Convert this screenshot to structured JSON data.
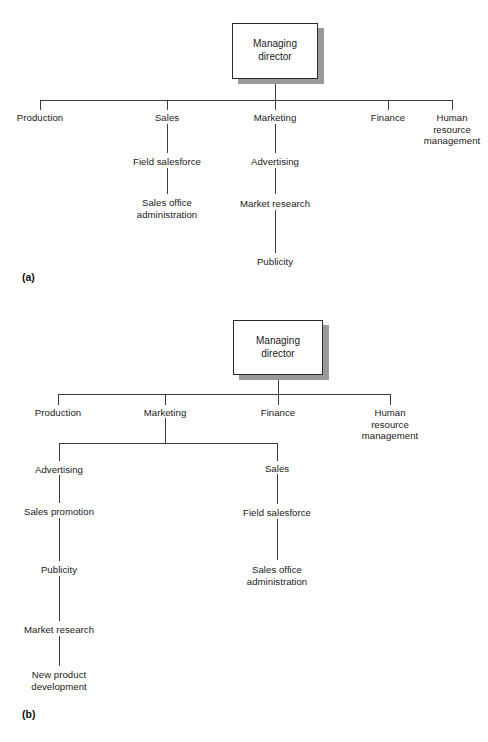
{
  "page": {
    "background_color": "#ffffff",
    "line_color": "#3c3c3c",
    "text_color": "#1a1a1a",
    "shadow_color": "#9a9a9a"
  },
  "figures": [
    {
      "key": "a",
      "caption": "(a)",
      "root": "Managing\ndirector",
      "level1": [
        {
          "key": "production",
          "label": "Production"
        },
        {
          "key": "sales",
          "label": "Sales"
        },
        {
          "key": "marketing",
          "label": "Marketing"
        },
        {
          "key": "finance",
          "label": "Finance"
        },
        {
          "key": "hrm",
          "label": "Human\nresource\nmanagement"
        }
      ],
      "chains": [
        {
          "parent": "sales",
          "nodes": [
            {
              "key": "field-salesforce",
              "label": "Field salesforce"
            },
            {
              "key": "sales-office-administration",
              "label": "Sales office\nadministration"
            }
          ]
        },
        {
          "parent": "marketing",
          "nodes": [
            {
              "key": "advertising",
              "label": "Advertising"
            },
            {
              "key": "market-research",
              "label": "Market research"
            },
            {
              "key": "publicity",
              "label": "Publicity"
            }
          ]
        }
      ]
    },
    {
      "key": "b",
      "caption": "(b)",
      "root": "Managing\ndirector",
      "level1": [
        {
          "key": "production",
          "label": "Production"
        },
        {
          "key": "marketing",
          "label": "Marketing"
        },
        {
          "key": "finance",
          "label": "Finance"
        },
        {
          "key": "hrm",
          "label": "Human\nresource\nmanagement"
        }
      ],
      "level2": [
        {
          "key": "advertising",
          "label": "Advertising",
          "parent": "marketing"
        },
        {
          "key": "sales",
          "label": "Sales",
          "parent": "marketing"
        }
      ],
      "chains": [
        {
          "parent": "advertising",
          "nodes": [
            {
              "key": "sales-promotion",
              "label": "Sales promotion"
            },
            {
              "key": "publicity",
              "label": "Publicity"
            },
            {
              "key": "market-research",
              "label": "Market research"
            },
            {
              "key": "new-product-development",
              "label": "New product\ndevelopment"
            }
          ]
        },
        {
          "parent": "sales",
          "nodes": [
            {
              "key": "field-salesforce",
              "label": "Field salesforce"
            },
            {
              "key": "sales-office-administration",
              "label": "Sales office\nadministration"
            }
          ]
        }
      ]
    }
  ],
  "chart_a": {
    "root_label": "Managing\ndirector",
    "caption": "(a)",
    "n_production": "Production",
    "n_sales": "Sales",
    "n_marketing": "Marketing",
    "n_finance": "Finance",
    "n_hrm": "Human\nresource\nmanagement",
    "n_field_salesforce": "Field salesforce",
    "n_sales_office": "Sales office\nadministration",
    "n_advertising": "Advertising",
    "n_market_research": "Market research",
    "n_publicity": "Publicity"
  },
  "chart_b": {
    "root_label": "Managing\ndirector",
    "caption": "(b)",
    "n_production": "Production",
    "n_marketing": "Marketing",
    "n_finance": "Finance",
    "n_hrm": "Human\nresource\nmanagement",
    "n_advertising": "Advertising",
    "n_sales": "Sales",
    "n_sales_promotion": "Sales promotion",
    "n_publicity": "Publicity",
    "n_market_research": "Market research",
    "n_new_product": "New product\ndevelopment",
    "n_field_salesforce": "Field salesforce",
    "n_sales_office": "Sales office\nadministration"
  }
}
